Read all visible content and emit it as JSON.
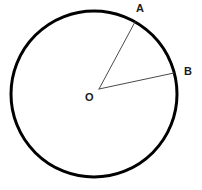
{
  "figure": {
    "background_color": "#ffffff",
    "stroke_color": "#000000",
    "radius_line_color": "#4a4a4a",
    "label_color": "#1a1a1a"
  },
  "labels": {
    "center": "O",
    "point_a": "A",
    "point_b": "B"
  },
  "chart_data": {
    "type": "diagram",
    "shapes": [
      {
        "name": "circle",
        "kind": "circle",
        "cx": 94,
        "cy": 94,
        "r": 83,
        "stroke": "#000000",
        "stroke_width": 3,
        "fill": "none"
      },
      {
        "name": "radius-OA",
        "kind": "line",
        "x1": 99,
        "y1": 89,
        "x2": 135,
        "y2": 22,
        "stroke": "#4a4a4a",
        "stroke_width": 1
      },
      {
        "name": "radius-OB",
        "kind": "line",
        "x1": 99,
        "y1": 89,
        "x2": 174,
        "y2": 73,
        "stroke": "#4a4a4a",
        "stroke_width": 1
      }
    ],
    "points": [
      {
        "name": "O",
        "label": "O",
        "x": 99,
        "y": 89,
        "label_x": 90,
        "label_y": 97
      },
      {
        "name": "A",
        "label": "A",
        "x": 135,
        "y": 22,
        "label_x": 141,
        "label_y": 8
      },
      {
        "name": "B",
        "label": "B",
        "x": 174,
        "y": 73,
        "label_x": 189,
        "label_y": 71
      }
    ],
    "grid": false,
    "legend": null,
    "xlabel": "",
    "ylabel": ""
  }
}
